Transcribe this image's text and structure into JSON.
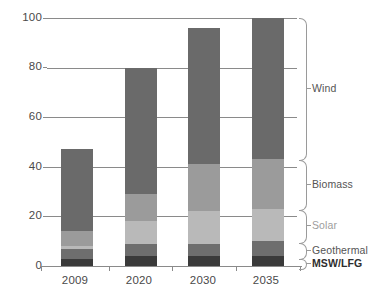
{
  "chart_data": {
    "type": "bar",
    "stacked": true,
    "title": "",
    "subtitle": "",
    "xlabel": "",
    "ylabel": "",
    "categories": [
      "2009",
      "2020",
      "2030",
      "2035"
    ],
    "ylim": [
      0,
      100
    ],
    "yticks": [
      0,
      20,
      40,
      60,
      80,
      100
    ],
    "ytick_labels": [
      "0",
      "20",
      "40",
      "60",
      "80",
      "100"
    ],
    "grid": true,
    "legend_position": "right",
    "series": [
      {
        "name": "MSW/LFG",
        "color": "#3a3a3a",
        "values": [
          3,
          4,
          4,
          4
        ]
      },
      {
        "name": "Geothermal",
        "color": "#6e6e6e",
        "values": [
          4,
          5,
          5,
          6
        ]
      },
      {
        "name": "Solar",
        "color": "#b9b9b9",
        "values": [
          1,
          9,
          13,
          13
        ]
      },
      {
        "name": "Biomass",
        "color": "#9b9b9b",
        "values": [
          6,
          11,
          19,
          20
        ]
      },
      {
        "name": "Wind",
        "color": "#6a6a6a",
        "values": [
          33,
          51,
          55,
          57
        ]
      }
    ],
    "totals": [
      47,
      80,
      96,
      100
    ]
  },
  "legend": {
    "items": [
      {
        "label": "Wind"
      },
      {
        "label": "Biomass"
      },
      {
        "label": "Solar"
      },
      {
        "label": "Geothermal"
      },
      {
        "label": "MSW/LFG"
      }
    ]
  }
}
